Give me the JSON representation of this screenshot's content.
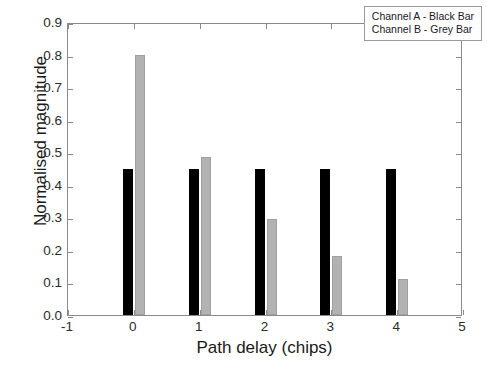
{
  "chart_data": {
    "type": "bar",
    "title": "",
    "subtitle": "",
    "xlabel": "Path delay (chips)",
    "ylabel": "Normalised magnitude",
    "categories": [
      0,
      1,
      2,
      3,
      4
    ],
    "xlim": [
      -1,
      5
    ],
    "ylim": [
      0.0,
      0.9
    ],
    "xticks": [
      "-1",
      "0",
      "1",
      "2",
      "3",
      "4",
      "5"
    ],
    "xtick_values": [
      -1,
      0,
      1,
      2,
      3,
      4,
      5
    ],
    "yticks": [
      "0.0",
      "0.1",
      "0.2",
      "0.3",
      "0.4",
      "0.5",
      "0.6",
      "0.7",
      "0.8",
      "0.9"
    ],
    "ytick_values": [
      0.0,
      0.1,
      0.2,
      0.3,
      0.4,
      0.5,
      0.6,
      0.7,
      0.8,
      0.9
    ],
    "grid": false,
    "legend_position": "top-right",
    "series": [
      {
        "name": "Channel A - Black Bar",
        "color": "#000000",
        "values": [
          0.45,
          0.45,
          0.45,
          0.45,
          0.45
        ]
      },
      {
        "name": "Channel B - Grey Bar",
        "color": "#b2b2b2",
        "values": [
          0.8,
          0.485,
          0.295,
          0.18,
          0.11
        ]
      }
    ],
    "annotations": []
  },
  "legend": {
    "entries": [
      "Channel A - Black Bar",
      "Channel B - Grey Bar"
    ]
  },
  "watermark": {
    "text": "channel-ab.jpg"
  }
}
